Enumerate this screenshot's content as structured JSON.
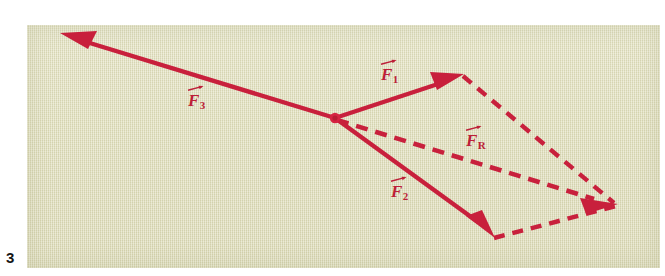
{
  "figure": {
    "number": "3",
    "caption": "",
    "panel_background_color": "#e3e2c0",
    "vector_color": "#c8203c",
    "label_color": "#bd1f38"
  },
  "diagram": {
    "type": "vector-force-diagram",
    "origin": {
      "x": 335,
      "y": 118,
      "label": "common-origin-point"
    },
    "vectors": [
      {
        "id": "F1",
        "label": "F",
        "subscript": "1",
        "style": "solid",
        "arrowhead": true,
        "from": {
          "x": 335,
          "y": 118
        },
        "to": {
          "x": 462,
          "y": 75
        },
        "label_pos": {
          "x": 381,
          "y": 66
        }
      },
      {
        "id": "F2",
        "label": "F",
        "subscript": "2",
        "style": "solid",
        "arrowhead": true,
        "from": {
          "x": 335,
          "y": 118
        },
        "to": {
          "x": 493,
          "y": 237
        },
        "label_pos": {
          "x": 391,
          "y": 183
        }
      },
      {
        "id": "F3",
        "label": "F",
        "subscript": "3",
        "style": "solid",
        "arrowhead": true,
        "from": {
          "x": 335,
          "y": 118
        },
        "to": {
          "x": 62,
          "y": 34
        },
        "label_pos": {
          "x": 188,
          "y": 92
        }
      },
      {
        "id": "FR",
        "label": "F",
        "subscript": "R",
        "style": "dashed",
        "arrowhead": true,
        "from": {
          "x": 335,
          "y": 118
        },
        "to": {
          "x": 614,
          "y": 203
        },
        "label_pos": {
          "x": 466,
          "y": 132
        }
      }
    ],
    "construction_lines": [
      {
        "id": "parallel-from-F1-tip",
        "style": "dashed",
        "arrowhead": false,
        "from": {
          "x": 462,
          "y": 75
        },
        "to": {
          "x": 616,
          "y": 204
        }
      },
      {
        "id": "parallel-from-F2-tip",
        "style": "dashed",
        "arrowhead": false,
        "from": {
          "x": 493,
          "y": 237
        },
        "to": {
          "x": 616,
          "y": 204
        }
      }
    ]
  }
}
